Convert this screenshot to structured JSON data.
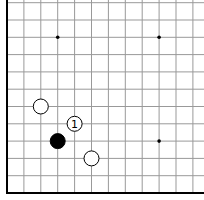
{
  "diagram": {
    "type": "go-board-corner",
    "colors": {
      "background": "#ffffff",
      "line": "#999999",
      "edge": "#000000",
      "black_stone": "#000000",
      "white_stone": "#ffffff"
    },
    "grid": {
      "columns": 12,
      "rows": 12,
      "origin_x": 7,
      "origin_y": 193,
      "spacing_x": 16.9,
      "spacing_y": 17.3,
      "edges": [
        "left",
        "bottom"
      ]
    },
    "star_points": [
      {
        "col": 3,
        "row": 9
      },
      {
        "col": 9,
        "row": 9
      },
      {
        "col": 9,
        "row": 3
      }
    ],
    "stones": [
      {
        "color": "white",
        "col": 2,
        "row": 5,
        "label": ""
      },
      {
        "color": "white",
        "col": 4,
        "row": 4,
        "label": "1"
      },
      {
        "color": "black",
        "col": 3,
        "row": 3,
        "label": ""
      },
      {
        "color": "white",
        "col": 5,
        "row": 2,
        "label": ""
      }
    ]
  }
}
